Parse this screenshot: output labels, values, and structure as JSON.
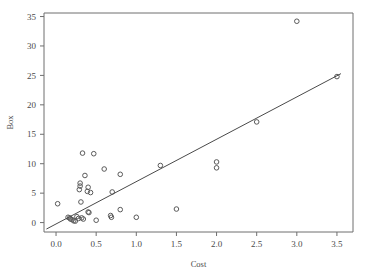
{
  "chart_data": {
    "type": "scatter",
    "title": "",
    "xlabel": "Cost",
    "ylabel": "Box",
    "xlim": [
      -0.15,
      3.7
    ],
    "ylim": [
      -1.6,
      35.6
    ],
    "xticks": [
      "0.0",
      "0.5",
      "1.0",
      "1.5",
      "2.0",
      "2.5",
      "3.0",
      "3.5"
    ],
    "xtick_values": [
      0.0,
      0.5,
      1.0,
      1.5,
      2.0,
      2.5,
      3.0,
      3.5
    ],
    "yticks": [
      "0",
      "5",
      "10",
      "15",
      "20",
      "25",
      "30",
      "35"
    ],
    "ytick_values": [
      0,
      5,
      10,
      15,
      20,
      25,
      30,
      35
    ],
    "grid": false,
    "legend": null,
    "marker_style": "open-circle",
    "points": [
      {
        "x": 0.02,
        "y": 3.2
      },
      {
        "x": 0.15,
        "y": 0.9
      },
      {
        "x": 0.17,
        "y": 0.8
      },
      {
        "x": 0.18,
        "y": 0.6
      },
      {
        "x": 0.2,
        "y": 0.5
      },
      {
        "x": 0.22,
        "y": 0.3
      },
      {
        "x": 0.24,
        "y": 0.25
      },
      {
        "x": 0.26,
        "y": 1.0
      },
      {
        "x": 0.28,
        "y": 0.7
      },
      {
        "x": 0.29,
        "y": 5.6
      },
      {
        "x": 0.3,
        "y": 6.2
      },
      {
        "x": 0.3,
        "y": 6.7
      },
      {
        "x": 0.31,
        "y": 3.5
      },
      {
        "x": 0.32,
        "y": 0.8
      },
      {
        "x": 0.33,
        "y": 11.8
      },
      {
        "x": 0.34,
        "y": 0.6
      },
      {
        "x": 0.36,
        "y": 8.0
      },
      {
        "x": 0.39,
        "y": 5.3
      },
      {
        "x": 0.4,
        "y": 6.0
      },
      {
        "x": 0.4,
        "y": 1.8
      },
      {
        "x": 0.41,
        "y": 1.7
      },
      {
        "x": 0.43,
        "y": 5.1
      },
      {
        "x": 0.47,
        "y": 11.7
      },
      {
        "x": 0.5,
        "y": 0.4
      },
      {
        "x": 0.6,
        "y": 9.1
      },
      {
        "x": 0.68,
        "y": 1.2
      },
      {
        "x": 0.69,
        "y": 0.9
      },
      {
        "x": 0.7,
        "y": 5.2
      },
      {
        "x": 0.8,
        "y": 8.2
      },
      {
        "x": 0.8,
        "y": 2.2
      },
      {
        "x": 1.0,
        "y": 0.9
      },
      {
        "x": 1.3,
        "y": 9.7
      },
      {
        "x": 1.5,
        "y": 2.3
      },
      {
        "x": 2.0,
        "y": 10.3
      },
      {
        "x": 2.0,
        "y": 9.3
      },
      {
        "x": 2.5,
        "y": 17.1
      },
      {
        "x": 3.0,
        "y": 34.2
      },
      {
        "x": 3.5,
        "y": 24.8
      }
    ],
    "fit_line": {
      "type": "linear-regression",
      "x_start": -0.12,
      "y_start": -1.1,
      "x_end": 3.55,
      "y_end": 25.3
    },
    "colors": {
      "marker_stroke": "#5a5a5a",
      "axis": "#6e6e6e",
      "fit_line": "#4a4a4a",
      "text": "#4a4a4a",
      "background": "#ffffff"
    }
  }
}
